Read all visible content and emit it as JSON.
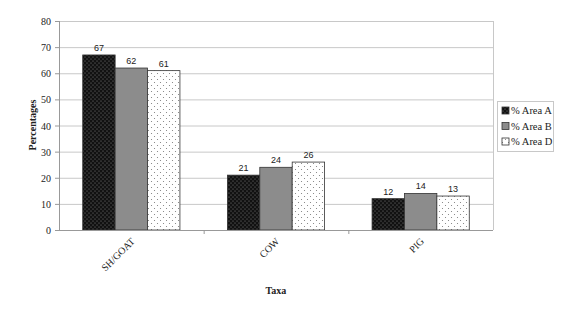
{
  "chart_data": {
    "type": "bar",
    "title": "",
    "xlabel": "Taxa",
    "ylabel": "Percentages",
    "ylim": [
      0,
      80
    ],
    "yticks": [
      0,
      10,
      20,
      30,
      40,
      50,
      60,
      70,
      80
    ],
    "grid": true,
    "legend_position": "right",
    "categories": [
      "SH/GOAT",
      "COW",
      "PIG"
    ],
    "series": [
      {
        "name": "% Area A",
        "values": [
          67,
          21,
          12
        ],
        "fill": "#111111",
        "pattern": "dense-dots"
      },
      {
        "name": "% Area B",
        "values": [
          62,
          24,
          14
        ],
        "fill": "#8c8c8c",
        "pattern": "solid"
      },
      {
        "name": "% Area D",
        "values": [
          61,
          26,
          13
        ],
        "fill": "#ffffff",
        "pattern": "sparse-dots"
      }
    ],
    "data_labels": true
  }
}
